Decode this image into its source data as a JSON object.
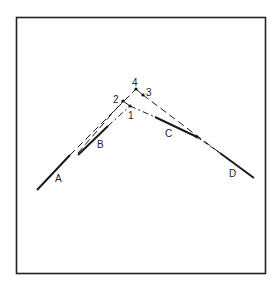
{
  "figure": {
    "segments": [
      {
        "label": "A",
        "style": "solid"
      },
      {
        "label": "B",
        "style": "solid"
      },
      {
        "label": "C",
        "style": "solid"
      },
      {
        "label": "D",
        "style": "solid"
      }
    ],
    "points": [
      {
        "label": "1"
      },
      {
        "label": "2"
      },
      {
        "label": "3"
      },
      {
        "label": "4"
      }
    ],
    "colors": {
      "line": "#1a1a1a",
      "frame": "#222222",
      "background": "#ffffff"
    }
  }
}
